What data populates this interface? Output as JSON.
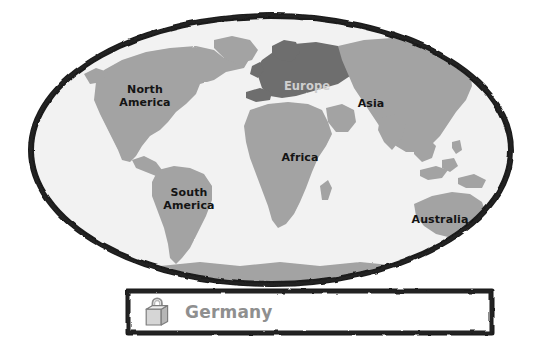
{
  "canvas": {
    "width": 543,
    "height": 358,
    "background": "#ffffff"
  },
  "map": {
    "name": "world-map",
    "style": "hand-drawn-oval-frame",
    "projection": "elliptical",
    "frame_color": "#1a1a1a",
    "ocean_color": "#f2f2f2",
    "land_color": "#a3a3a3",
    "highlight_color": "#6e6e6e",
    "labels": [
      {
        "id": "north-america",
        "text": "North\nAmerica",
        "x": 145,
        "y": 96,
        "faded": false
      },
      {
        "id": "europe",
        "text": "Europe",
        "x": 307,
        "y": 86,
        "faded": true
      },
      {
        "id": "asia",
        "text": "Asia",
        "x": 371,
        "y": 104,
        "faded": false
      },
      {
        "id": "africa",
        "text": "Africa",
        "x": 300,
        "y": 158,
        "faded": false
      },
      {
        "id": "south-america",
        "text": "South\nAmerica",
        "x": 189,
        "y": 199,
        "faded": false
      },
      {
        "id": "australia",
        "text": "Australia",
        "x": 440,
        "y": 220,
        "faded": false
      }
    ]
  },
  "panel": {
    "name": "country-selection-panel",
    "icon": "shopping-bag-icon",
    "label": "Germany",
    "label_color": "#8f8f8f",
    "border_color": "#1a1a1a",
    "background": "#ffffff"
  }
}
